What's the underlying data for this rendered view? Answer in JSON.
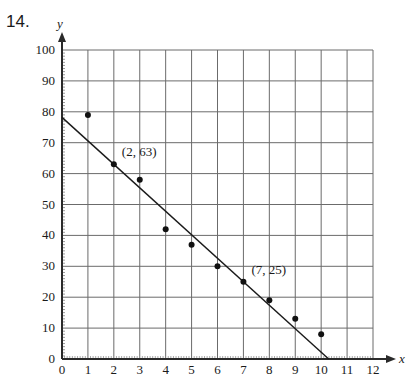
{
  "problem": {
    "number": "14."
  },
  "chart_data": {
    "type": "scatter",
    "title": "",
    "xlabel": "x",
    "ylabel": "y",
    "xlim": [
      0,
      12
    ],
    "ylim": [
      0,
      100
    ],
    "grid": true,
    "x_ticks": [
      0,
      1,
      2,
      3,
      4,
      5,
      6,
      7,
      8,
      9,
      10,
      11,
      12
    ],
    "y_ticks": [
      0,
      10,
      20,
      30,
      40,
      50,
      60,
      70,
      80,
      90,
      100
    ],
    "series": [
      {
        "name": "data points",
        "type": "scatter",
        "x": [
          1,
          2,
          3,
          4,
          5,
          6,
          7,
          8,
          9,
          10
        ],
        "y": [
          79,
          63,
          58,
          42,
          37,
          30,
          25,
          19,
          13,
          8
        ]
      },
      {
        "name": "line of fit",
        "type": "line",
        "x": [
          0,
          10.29
        ],
        "y": [
          78.2,
          0
        ]
      }
    ],
    "annotations": [
      {
        "text": "(2, 63)",
        "x": 2,
        "y": 63
      },
      {
        "text": "(7, 25)",
        "x": 7,
        "y": 25
      }
    ],
    "legend": null
  }
}
